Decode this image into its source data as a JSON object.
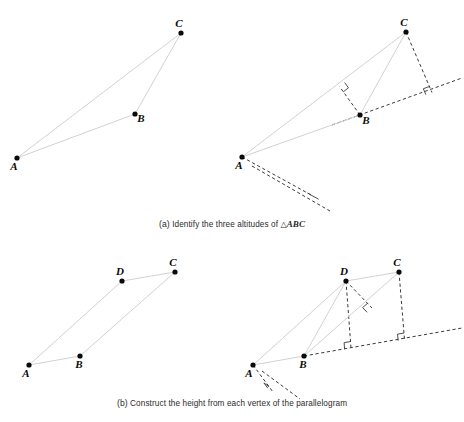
{
  "figure": {
    "background_color": "#ffffff",
    "solid_edge_color": "#d2d2d2",
    "dashed_edge_color": "#3a3a3a",
    "vertex_color": "#0a0a0a"
  },
  "captions": {
    "a": {
      "tag": "(a)",
      "text": "Identify the three altitudes of",
      "triangle_symbol": "△",
      "shape": "ABC"
    },
    "b": {
      "tag": "(b)",
      "text": "Construct the height from each vertex of the parallelogram"
    }
  },
  "panels": [
    {
      "id": "a-left",
      "name": "triangle-plain",
      "shape": "triangle",
      "vertices": [
        {
          "label": "A",
          "x": 17,
          "y": 158,
          "label_dx": -3,
          "label_dy": 12
        },
        {
          "label": "B",
          "x": 135,
          "y": 114,
          "label_dx": 6,
          "label_dy": 8
        },
        {
          "label": "C",
          "x": 181,
          "y": 33,
          "label_dx": -2,
          "label_dy": -6
        }
      ],
      "solid_edges": [
        [
          "A",
          "C"
        ],
        [
          "A",
          "B"
        ],
        [
          "B",
          "C"
        ]
      ],
      "dashed_edges": [],
      "right_angle_marks": []
    },
    {
      "id": "a-right",
      "name": "triangle-with-altitudes",
      "shape": "triangle",
      "vertices": [
        {
          "label": "A",
          "x": 242,
          "y": 157,
          "label_dx": -3,
          "label_dy": 12
        },
        {
          "label": "B",
          "x": 360,
          "y": 115,
          "label_dx": 6,
          "label_dy": 9
        },
        {
          "label": "C",
          "x": 406,
          "y": 32,
          "label_dx": -2,
          "label_dy": -6
        }
      ],
      "solid_edges": [
        [
          "A",
          "C"
        ],
        [
          "A",
          "B"
        ],
        [
          "B",
          "C"
        ]
      ],
      "altitudes": [
        {
          "from": "B",
          "foot_x": 339.5,
          "foot_y": 86.5,
          "to_line": "AC"
        },
        {
          "from": "C",
          "foot_x": 432.0,
          "foot_y": 92.5,
          "to_line": "AB-extended"
        },
        {
          "from": "A",
          "foot_x": 313.0,
          "foot_y": 196.0,
          "to_line": "BC-extended"
        }
      ],
      "extension_lines": [
        {
          "name": "AB-extended",
          "x1": 332,
          "y1": 125,
          "x2": 462,
          "y2": 78
        },
        {
          "name": "BC-extended",
          "x1": 252,
          "y1": 166,
          "x2": 330,
          "y2": 211
        }
      ],
      "right_angle_marks": [
        {
          "x": 339.5,
          "y": 86.5
        },
        {
          "x": 432.0,
          "y": 92.5
        },
        {
          "x": 313.0,
          "y": 196.0
        }
      ]
    },
    {
      "id": "b-left",
      "name": "parallelogram-plain",
      "shape": "parallelogram",
      "vertices": [
        {
          "label": "A",
          "x": 29,
          "y": 365,
          "label_dx": -3,
          "label_dy": 12
        },
        {
          "label": "B",
          "x": 80,
          "y": 356,
          "label_dx": -1,
          "label_dy": 12
        },
        {
          "label": "C",
          "x": 175,
          "y": 272,
          "label_dx": -2,
          "label_dy": -6
        },
        {
          "label": "D",
          "x": 122,
          "y": 281,
          "label_dx": -2,
          "label_dy": -6
        }
      ],
      "solid_edges": [
        [
          "A",
          "B"
        ],
        [
          "B",
          "C"
        ],
        [
          "C",
          "D"
        ],
        [
          "D",
          "A"
        ]
      ],
      "dashed_edges": [],
      "right_angle_marks": []
    },
    {
      "id": "b-right",
      "name": "parallelogram-with-heights",
      "shape": "parallelogram",
      "vertices": [
        {
          "label": "A",
          "x": 253,
          "y": 365,
          "label_dx": -4,
          "label_dy": 12
        },
        {
          "label": "B",
          "x": 304,
          "y": 356,
          "label_dx": -1,
          "label_dy": 12
        },
        {
          "label": "C",
          "x": 399,
          "y": 272,
          "label_dx": -2,
          "label_dy": -6
        },
        {
          "label": "D",
          "x": 346,
          "y": 281,
          "label_dx": -2,
          "label_dy": -6
        }
      ],
      "solid_edges": [
        [
          "A",
          "B"
        ],
        [
          "B",
          "C"
        ],
        [
          "C",
          "D"
        ],
        [
          "D",
          "A"
        ],
        [
          "B",
          "D"
        ]
      ],
      "heights": [
        {
          "from": "D",
          "foot_x": 372.0,
          "foot_y": 308.0,
          "to_line": "BC"
        },
        {
          "from": "D",
          "foot_x": 351.0,
          "foot_y": 348.0,
          "to_line": "AB-extended"
        },
        {
          "from": "C",
          "foot_x": 404.5,
          "foot_y": 339.5,
          "to_line": "AB-extended"
        },
        {
          "from": "A",
          "foot_x": 273.0,
          "foot_y": 392.0,
          "to_line": "BC-extended"
        }
      ],
      "extension_lines": [
        {
          "name": "AB-extended",
          "x1": 304,
          "y1": 356,
          "x2": 462,
          "y2": 328
        },
        {
          "name": "BC-extended",
          "x1": 262,
          "y1": 371,
          "x2": 300,
          "y2": 399
        }
      ],
      "right_angle_marks": [
        {
          "x": 372.0,
          "y": 308.0
        },
        {
          "x": 351.0,
          "y": 348.0
        },
        {
          "x": 404.5,
          "y": 339.5
        },
        {
          "x": 273.0,
          "y": 392.0
        }
      ]
    }
  ]
}
